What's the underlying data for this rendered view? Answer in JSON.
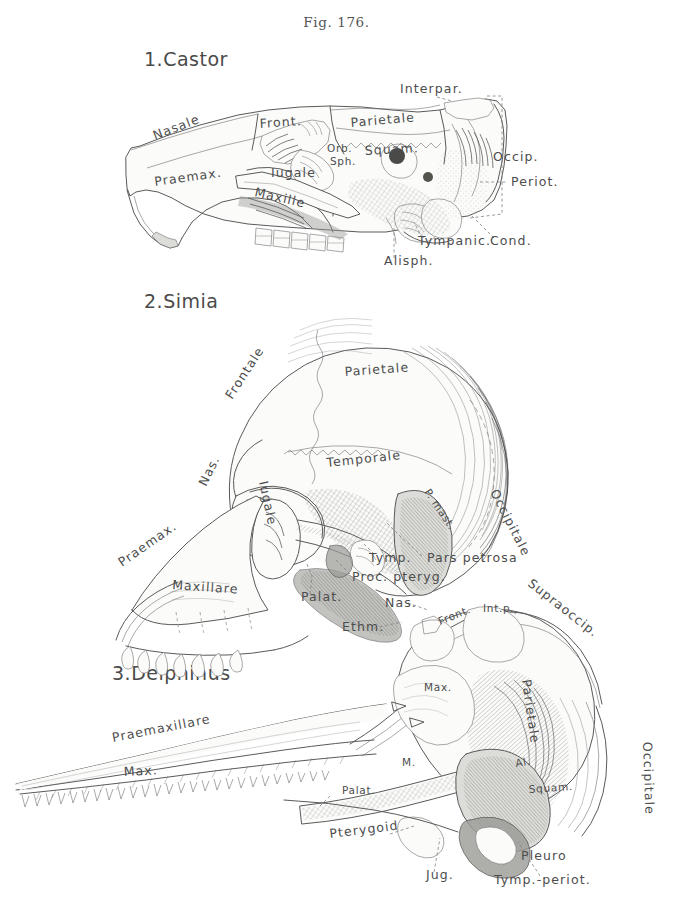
{
  "figure": {
    "caption": "Fig. 176.",
    "background_color": "#ffffff",
    "ink_color": "#5a5a5a",
    "label_color": "#4d4d4d"
  },
  "specimens": [
    {
      "id": "castor",
      "title": "1.Castor",
      "common_name": "beaver skull, lateral view",
      "labels": [
        {
          "name": "nasale",
          "text": "Nasale",
          "x": 155,
          "y": 140,
          "rotate": -21
        },
        {
          "name": "praemax",
          "text": "Praemax.",
          "x": 155,
          "y": 186,
          "rotate": -8
        },
        {
          "name": "front",
          "text": "Front.",
          "x": 260,
          "y": 128,
          "rotate": -4
        },
        {
          "name": "parietale",
          "text": "Parietale",
          "x": 351,
          "y": 127,
          "rotate": -5
        },
        {
          "name": "interpar",
          "text": "Interpar.",
          "x": 400,
          "y": 93,
          "rotate": 0
        },
        {
          "name": "squam",
          "text": "Squam.",
          "x": 365,
          "y": 155,
          "rotate": -3
        },
        {
          "name": "orb",
          "text": "Orb.",
          "x": 327,
          "y": 152,
          "rotate": 0
        },
        {
          "name": "sph",
          "text": "Sph.",
          "x": 330,
          "y": 165,
          "rotate": 0
        },
        {
          "name": "iugale",
          "text": "Iugale",
          "x": 271,
          "y": 177,
          "rotate": 0
        },
        {
          "name": "maxille",
          "text": "Maxille",
          "x": 254,
          "y": 196,
          "rotate": 13
        },
        {
          "name": "occip",
          "text": "Occip.",
          "x": 493,
          "y": 161,
          "rotate": 0
        },
        {
          "name": "periot",
          "text": "Periot.",
          "x": 511,
          "y": 186,
          "rotate": 0
        },
        {
          "name": "tympanic",
          "text": "Tympanic.",
          "x": 418,
          "y": 245,
          "rotate": 0
        },
        {
          "name": "cond",
          "text": "Cond.",
          "x": 490,
          "y": 245,
          "rotate": 0
        },
        {
          "name": "alisph",
          "text": "Alisph.",
          "x": 384,
          "y": 265,
          "rotate": 0
        }
      ]
    },
    {
      "id": "simia",
      "title": "2.Simia",
      "common_name": "monkey skull, lateral view",
      "labels": [
        {
          "name": "frontale",
          "text": "Frontale",
          "x": 232,
          "y": 400,
          "rotate": -57
        },
        {
          "name": "parietale",
          "text": "Parietale",
          "x": 345,
          "y": 376,
          "rotate": -4
        },
        {
          "name": "temporale",
          "text": "Temporale",
          "x": 327,
          "y": 467,
          "rotate": -6
        },
        {
          "name": "occipitale",
          "text": "Occipitale",
          "x": 490,
          "y": 492,
          "rotate": 63
        },
        {
          "name": "praemax",
          "text": "Praemax.",
          "x": 122,
          "y": 567,
          "rotate": -35
        },
        {
          "name": "nas",
          "text": "Nas.",
          "x": 206,
          "y": 487,
          "rotate": -64
        },
        {
          "name": "iugale",
          "text": "Iugale",
          "x": 259,
          "y": 482,
          "rotate": 78
        },
        {
          "name": "maxillare",
          "text": "Maxillare",
          "x": 172,
          "y": 589,
          "rotate": 4
        },
        {
          "name": "palat",
          "text": "Palat.",
          "x": 301,
          "y": 601,
          "rotate": 0
        },
        {
          "name": "proc-pteryg",
          "text": "Proc. pteryg.",
          "x": 352,
          "y": 581,
          "rotate": 0
        },
        {
          "name": "tymp",
          "text": "Tymp.",
          "x": 369,
          "y": 562,
          "rotate": 0
        },
        {
          "name": "pars-petrosa",
          "text": "Pars petrosa",
          "x": 427,
          "y": 562,
          "rotate": 0
        },
        {
          "name": "p-mast",
          "text": "P. mast.",
          "x": 424,
          "y": 492,
          "rotate": 56
        }
      ]
    },
    {
      "id": "delphinus",
      "title": "3.Delphinus",
      "common_name": "dolphin skull, lateral view",
      "labels": [
        {
          "name": "praemaxillare",
          "text": "Praemaxillare",
          "x": 113,
          "y": 742,
          "rotate": -11
        },
        {
          "name": "max-rostrum",
          "text": "Max.",
          "x": 124,
          "y": 776,
          "rotate": -3
        },
        {
          "name": "nas",
          "text": "Nas.",
          "x": 385,
          "y": 607,
          "rotate": 0
        },
        {
          "name": "ethm",
          "text": "Ethm.",
          "x": 342,
          "y": 631,
          "rotate": 0
        },
        {
          "name": "front",
          "text": "Front.",
          "x": 440,
          "y": 625,
          "rotate": -22
        },
        {
          "name": "int-p",
          "text": "Int.p.",
          "x": 483,
          "y": 612,
          "rotate": 0
        },
        {
          "name": "supraoccip",
          "text": "Supraoccip.",
          "x": 527,
          "y": 585,
          "rotate": 38
        },
        {
          "name": "parietale",
          "text": "Parietale",
          "x": 522,
          "y": 680,
          "rotate": 82
        },
        {
          "name": "max-cranium",
          "text": "Max.",
          "x": 424,
          "y": 691,
          "rotate": 0
        },
        {
          "name": "occipitale",
          "text": "Occipitale",
          "x": 643,
          "y": 742,
          "rotate": 88
        },
        {
          "name": "al",
          "text": "Al.",
          "x": 516,
          "y": 767,
          "rotate": -10
        },
        {
          "name": "squam",
          "text": "Squam.",
          "x": 529,
          "y": 793,
          "rotate": -4
        },
        {
          "name": "m",
          "text": "M.",
          "x": 402,
          "y": 766,
          "rotate": 0
        },
        {
          "name": "palat",
          "text": "Palat.",
          "x": 342,
          "y": 794,
          "rotate": 0
        },
        {
          "name": "pterygoid",
          "text": "Pterygoid",
          "x": 330,
          "y": 838,
          "rotate": -7
        },
        {
          "name": "jug",
          "text": "Jug.",
          "x": 426,
          "y": 879,
          "rotate": 0
        },
        {
          "name": "pleuro",
          "text": "Pleuro",
          "x": 521,
          "y": 860,
          "rotate": 0
        },
        {
          "name": "tymp-periot",
          "text": "Tymp.-periot.",
          "x": 494,
          "y": 884,
          "rotate": 0
        }
      ]
    }
  ]
}
